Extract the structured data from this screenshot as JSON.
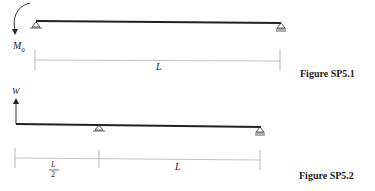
{
  "figures": [
    {
      "caption": "Figure SP5.1",
      "moment_label": "M",
      "moment_sub": "0",
      "span_label": "L"
    },
    {
      "caption": "Figure SP5.2",
      "load_label": "W",
      "overhang_label_num": "L",
      "overhang_label_den": "2",
      "span_label": "L"
    }
  ]
}
